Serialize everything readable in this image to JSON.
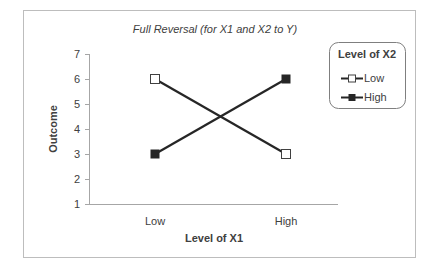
{
  "chart_data": {
    "type": "line",
    "title": "Full Reversal (for X1 and X2 to Y)",
    "xlabel": "Level of X1",
    "ylabel": "Outcome",
    "categories": [
      "Low",
      "High"
    ],
    "series": [
      {
        "name": "Low",
        "values": [
          6,
          3
        ],
        "marker": "open-square",
        "color": "#262626"
      },
      {
        "name": "High",
        "values": [
          3,
          6
        ],
        "marker": "filled-square",
        "color": "#262626"
      }
    ],
    "ylim": [
      1,
      7
    ],
    "yticks": [
      "1",
      "2",
      "3",
      "4",
      "5",
      "6",
      "7"
    ],
    "grid": false,
    "legend": {
      "title": "Level of X2",
      "position": "right",
      "entries": [
        "Low",
        "High"
      ]
    }
  }
}
